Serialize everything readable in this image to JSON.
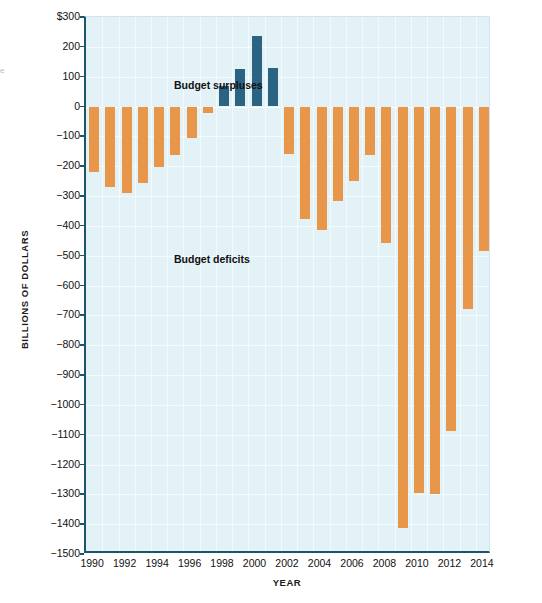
{
  "edge_fragment": "e",
  "axes": {
    "y_title": "BILLIONS OF DOLLARS",
    "x_title": "YEAR",
    "y_ticks": [
      "$300",
      "200",
      "100",
      "0",
      "−100",
      "−200",
      "−300",
      "−400",
      "−500",
      "−600",
      "−700",
      "−800",
      "−900",
      "−1000",
      "−1100",
      "−1200",
      "−1300",
      "−1400",
      "−1500"
    ],
    "x_ticks": [
      "1990",
      "1992",
      "1994",
      "1996",
      "1998",
      "2000",
      "2002",
      "2004",
      "2006",
      "2008",
      "2010",
      "2012",
      "2014"
    ]
  },
  "annotations": {
    "surplus": "Budget surpluses",
    "deficit": "Budget deficits"
  },
  "colors": {
    "deficit_bar": "#e8974a",
    "surplus_bar": "#2a6482",
    "plot_background": "#e2f2f7",
    "axis_line": "#1d5668",
    "gridline": "#f4fbfd"
  },
  "chart_data": {
    "type": "bar",
    "title": "",
    "subtitle": "",
    "xlabel": "YEAR",
    "ylabel": "BILLIONS OF DOLLARS",
    "ylim": [
      -1500,
      300
    ],
    "xlim": [
      1989.5,
      2014.5
    ],
    "ytick_values": [
      300,
      200,
      100,
      0,
      -100,
      -200,
      -300,
      -400,
      -500,
      -600,
      -700,
      -800,
      -900,
      -1000,
      -1100,
      -1200,
      -1300,
      -1400,
      -1500
    ],
    "ytick_step": 100,
    "xtick_values": [
      1990,
      1992,
      1994,
      1996,
      1998,
      2000,
      2002,
      2004,
      2006,
      2008,
      2010,
      2012,
      2014
    ],
    "grid": true,
    "legend": false,
    "categories": [
      1990,
      1991,
      1992,
      1993,
      1994,
      1995,
      1996,
      1997,
      1998,
      1999,
      2000,
      2001,
      2002,
      2003,
      2004,
      2005,
      2006,
      2007,
      2008,
      2009,
      2010,
      2011,
      2012,
      2013,
      2014
    ],
    "values": [
      -221,
      -269,
      -290,
      -255,
      -203,
      -164,
      -107,
      -22,
      69,
      126,
      236,
      128,
      -158,
      -378,
      -413,
      -318,
      -248,
      -161,
      -459,
      -1413,
      -1294,
      -1300,
      -1087,
      -680,
      -485
    ],
    "series": [
      {
        "name": "Federal budget surplus or deficit",
        "values": [
          -221,
          -269,
          -290,
          -255,
          -203,
          -164,
          -107,
          -22,
          69,
          126,
          236,
          128,
          -158,
          -378,
          -413,
          -318,
          -248,
          -161,
          -459,
          -1413,
          -1294,
          -1300,
          -1087,
          -680,
          -485
        ]
      }
    ],
    "annotations": [
      {
        "text": "Budget surpluses",
        "x": 1990.3,
        "y": 160
      },
      {
        "text": "Budget deficits",
        "x": 1990.3,
        "y": -430
      }
    ]
  }
}
